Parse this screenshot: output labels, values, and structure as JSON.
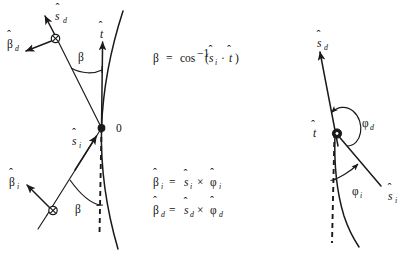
{
  "figure": {
    "name": "scattering-geometry-diagram",
    "background_color": "#ffffff",
    "ink_color": "#1a1a1a",
    "panels": [
      {
        "id": "left-panel",
        "description": "Side view of curved particle trajectory showing beta angles between incident/detected directions and the tangent",
        "origin_label": "0",
        "labels": [
          {
            "id": "s-hat-d",
            "base": "s",
            "accent": "hat",
            "subscript": "d",
            "text": "ŝ_d"
          },
          {
            "id": "beta-hat-d",
            "base": "β",
            "accent": "hat",
            "subscript": "d",
            "text": "β̂_d"
          },
          {
            "id": "t-hat",
            "base": "t",
            "accent": "hat",
            "subscript": "",
            "text": "t̂"
          },
          {
            "id": "beta-angle-upper",
            "base": "β",
            "accent": "none",
            "subscript": "",
            "text": "β"
          },
          {
            "id": "beta-angle-lower",
            "base": "β",
            "accent": "none",
            "subscript": "",
            "text": "β"
          },
          {
            "id": "s-hat-i",
            "base": "s",
            "accent": "hat",
            "subscript": "i",
            "text": "ŝ_i"
          },
          {
            "id": "beta-hat-i",
            "base": "β",
            "accent": "hat",
            "subscript": "i",
            "text": "β̂_i"
          }
        ],
        "equations": [
          {
            "id": "eq-beta",
            "text": "β = cos⁻¹(ŝᵢ · t̂)",
            "parts": {
              "lhs": "β",
              "op": "=",
              "fn": "cos",
              "exponent": "−1",
              "arg_left": "s",
              "arg_left_sub": "i",
              "dot": "·",
              "arg_right": "t"
            }
          },
          {
            "id": "eq-beta-i",
            "text": "β̂ᵢ = ŝᵢ × φ̂ᵢ",
            "parts": {
              "lhs": "β",
              "lhs_sub": "i",
              "op": "=",
              "a": "s",
              "a_sub": "i",
              "cross": "×",
              "b": "φ",
              "b_sub": "i"
            }
          },
          {
            "id": "eq-beta-d",
            "text": "β̂_d = ŝ_d × φ̂_d",
            "parts": {
              "lhs": "β",
              "lhs_sub": "d",
              "op": "=",
              "a": "s",
              "a_sub": "d",
              "cross": "×",
              "b": "φ",
              "b_sub": "d"
            }
          }
        ],
        "markers": [
          {
            "id": "origin-dot",
            "shape": "filled-circle",
            "meaning": "field point 0"
          },
          {
            "id": "phi-d-into-page",
            "shape": "circle-with-x",
            "meaning": "phi-hat_d into page"
          },
          {
            "id": "phi-i-into-page",
            "shape": "circle-with-x",
            "meaning": "phi-hat_i into page"
          }
        ]
      },
      {
        "id": "right-panel",
        "description": "Projected view looking along the tangent t-hat showing azimuthal angles phi_i and phi_d",
        "labels": [
          {
            "id": "s-hat-d-right",
            "base": "s",
            "accent": "hat",
            "subscript": "d",
            "text": "ŝ_d"
          },
          {
            "id": "t-hat-right",
            "base": "t",
            "accent": "hat",
            "subscript": "",
            "text": "t̂"
          },
          {
            "id": "phi-d",
            "base": "φ",
            "accent": "none",
            "subscript": "d",
            "text": "φ_d"
          },
          {
            "id": "phi-i",
            "base": "φ",
            "accent": "none",
            "subscript": "i",
            "text": "φ_i"
          },
          {
            "id": "s-hat-i-right",
            "base": "s",
            "accent": "hat",
            "subscript": "i",
            "text": "ŝ_i"
          }
        ],
        "markers": [
          {
            "id": "t-hat-out-of-page",
            "shape": "circle-with-dot",
            "meaning": "t-hat out of page"
          }
        ]
      }
    ],
    "text": {
      "origin": "0",
      "beta": "β",
      "phi_d": "φ",
      "phi_i": "φ",
      "sub_d": "d",
      "sub_i": "i",
      "letter_s": "s",
      "letter_t": "t",
      "eq_sign": "=",
      "cos": "cos",
      "exponent_minus_one": "−1",
      "dot_operator": "·",
      "cross_operator": "×",
      "paren_open": "(",
      "paren_close": ")"
    }
  }
}
